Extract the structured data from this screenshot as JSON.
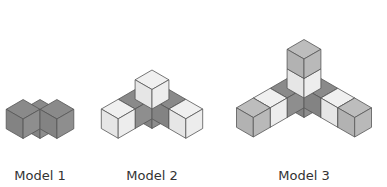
{
  "figure": {
    "models": [
      {
        "label": "Model 1",
        "arm_length": 1,
        "label_x": 40,
        "label_y": 168,
        "origin": [
          40,
          119
        ],
        "arm_colors": [
          "dark"
        ]
      },
      {
        "label": "Model 2",
        "arm_length": 2,
        "label_x": 152,
        "label_y": 168,
        "origin": [
          152,
          109
        ],
        "arm_colors": [
          "dark",
          "light"
        ]
      },
      {
        "label": "Model 3",
        "arm_length": 3,
        "label_x": 304,
        "label_y": 168,
        "origin": [
          304,
          98
        ],
        "arm_colors": [
          "dark",
          "light",
          "medium"
        ]
      }
    ],
    "colors": {
      "dark": {
        "top": "#8a8a8a",
        "left": "#838383",
        "right": "#8e8e8e"
      },
      "light": {
        "top": "#f0f0f0",
        "left": "#e6e6e6",
        "right": "#ededed"
      },
      "medium": {
        "top": "#bdbdbd",
        "left": "#b2b2b2",
        "right": "#b9b9b9"
      },
      "stroke": "#555555"
    },
    "cube_edge": 19.5
  }
}
